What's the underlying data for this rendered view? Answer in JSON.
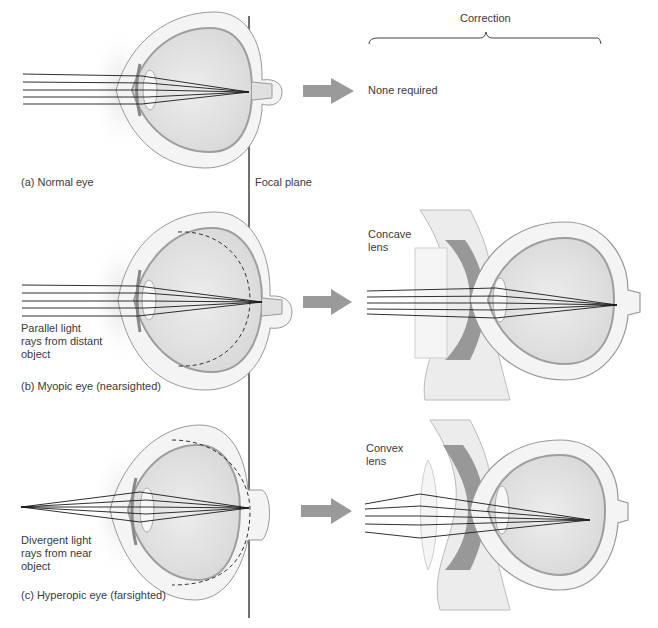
{
  "header": {
    "correction_label": "Correction"
  },
  "focal_plane_label": "Focal plane",
  "panels": [
    {
      "id": "a",
      "caption": "(a) Normal eye",
      "ray_label": "",
      "correction": "None required",
      "lens_label": ""
    },
    {
      "id": "b",
      "caption": "(b) Myopic eye (nearsighted)",
      "ray_label": "Parallel light\nrays from distant\nobject",
      "correction": "",
      "lens_label": "Concave\nlens"
    },
    {
      "id": "c",
      "caption": "(c) Hyperopic eye (farsighted)",
      "ray_label": "Divergent light\nrays from near\nobject",
      "correction": "",
      "lens_label": "Convex\nlens"
    }
  ],
  "colors": {
    "arrow": "#9a9a9a",
    "eye_fill": "#e6e6e6",
    "eye_wall": "#b5b5b5",
    "ray": "#1a1a1a",
    "tissue": "#7a7a7a"
  }
}
